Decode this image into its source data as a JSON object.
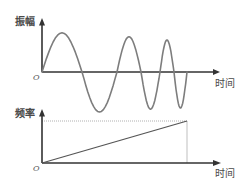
{
  "chart_data": [
    {
      "type": "line",
      "title": "",
      "xlabel": "时间",
      "ylabel": "振幅",
      "origin_label": "O",
      "grid": false,
      "legend": "none",
      "xlim": [
        0,
        1.22
      ],
      "ylim": [
        -1.0,
        1.35
      ],
      "series": [
        {
          "name": "振幅",
          "kind": "chirp (increasing-frequency sine)",
          "zero_crossings_t": [
            0,
            0.276,
            0.517,
            0.683,
            0.814,
            0.91,
            1.0
          ],
          "half_cycle_amplitudes": [
            0.98,
            -1.0,
            0.88,
            -0.93,
            0.8,
            -0.9
          ],
          "color": "#7d7d7d"
        }
      ]
    },
    {
      "type": "line",
      "title": "",
      "xlabel": "时间",
      "ylabel": "频率",
      "origin_label": "O",
      "grid": false,
      "legend": "none",
      "xlim": [
        0,
        1.22
      ],
      "ylim": [
        0,
        1.29
      ],
      "series": [
        {
          "name": "频率",
          "kind": "linear ramp",
          "x": [
            0,
            1.0
          ],
          "y": [
            0,
            1.0
          ],
          "color": "#555555"
        }
      ],
      "reference_lines": [
        {
          "orientation": "horizontal",
          "value": 1.0,
          "from": 0,
          "to": 1.0,
          "style": "dotted"
        },
        {
          "orientation": "vertical",
          "value": 1.0,
          "from": 0,
          "to": 1.0,
          "style": "thin"
        }
      ]
    }
  ]
}
